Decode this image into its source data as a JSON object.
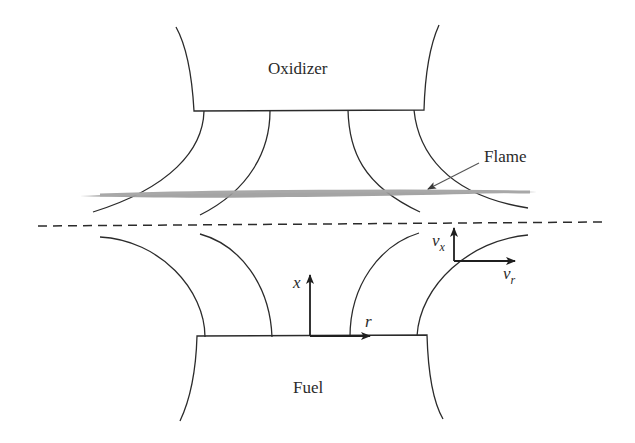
{
  "figure": {
    "colors": {
      "line": "#2b2b2b",
      "flame": "#9a9a9a",
      "background": "#ffffff"
    }
  },
  "labels": {
    "oxidizer": "Oxidizer",
    "fuel": "Fuel",
    "flame": "Flame",
    "axis_x": "x",
    "axis_r": "r",
    "velocity_x_main": "v",
    "velocity_x_sub": "x",
    "velocity_r_main": "v",
    "velocity_r_sub": "r"
  },
  "elements": {
    "oxidizer_nozzle": "upper nozzle",
    "fuel_nozzle": "lower nozzle",
    "stagnation_plane": "dashed line",
    "flame_sheet": "gray flame zone",
    "streamlines_upper": 4,
    "streamlines_lower": 4
  }
}
